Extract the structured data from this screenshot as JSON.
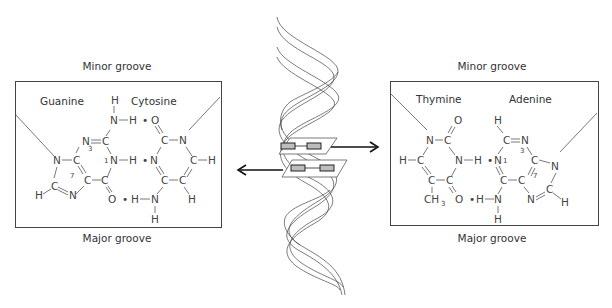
{
  "left_panel": {
    "top_label": "Minor groove",
    "bottom_label": "Major groove",
    "base_left": "Guanine",
    "base_right": "Cytosine",
    "ring_numbers": [
      "3",
      "1",
      "7"
    ]
  },
  "right_panel": {
    "top_label": "Minor groove",
    "bottom_label": "Major groove",
    "base_left": "Thymine",
    "base_right": "Adenine",
    "ring_numbers": [
      "1",
      "3",
      "7"
    ]
  },
  "atoms": {
    "H": "H",
    "N": "N",
    "C": "C",
    "O": "O",
    "CH3": "CH",
    "sub3": "3",
    "dot": "•"
  },
  "center": {
    "figure": "double-helix",
    "arrows": [
      "right-to-AT-pair",
      "left-to-GC-pair"
    ]
  },
  "colors": {
    "line": "#444444",
    "text": "#333333",
    "base_block": "#bdbdbd"
  }
}
